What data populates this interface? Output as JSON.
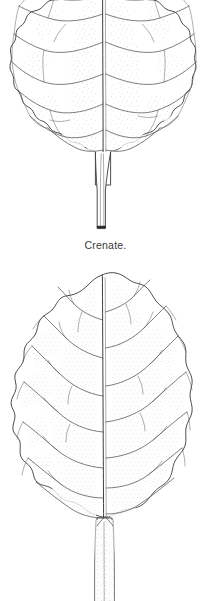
{
  "plate": {
    "title": "Leaf margin illustration plate",
    "background_color": "#ffffff",
    "ink_color": "#2e2e2e",
    "vein_color": "#4a4a4a",
    "caption_color": "#3a3a3a",
    "figure_count": 2
  },
  "figures": [
    {
      "id": "crenate",
      "label": "Crenate.",
      "margin_type": "crenate",
      "blade_shape": "obovate",
      "venation": "pinnate",
      "apex": "cropped at image top edge",
      "base": "attenuate",
      "petiole": "slender, tapering",
      "texture": "stippled",
      "caption_visible": true
    },
    {
      "id": "sinuate",
      "label": "",
      "margin_type": "sinuate / wavy",
      "blade_shape": "ovate-elliptic",
      "venation": "pinnate with branching laterals",
      "apex": "acute",
      "base": "cuneate",
      "petiole": "stout, pubescent (stippled)",
      "texture": "stippled",
      "caption_visible": false
    }
  ]
}
